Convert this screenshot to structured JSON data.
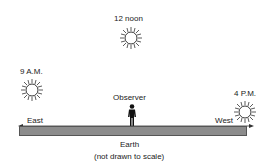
{
  "diagram": {
    "suns": [
      {
        "label": "12 noon",
        "position": "top-center"
      },
      {
        "label": "9 A.M.",
        "position": "left"
      },
      {
        "label": "4 P.M.",
        "position": "right"
      }
    ],
    "observer_label": "Observer",
    "directions": {
      "east": "East",
      "west": "West"
    },
    "ground_label": "Earth",
    "note": "(not drawn to scale)",
    "colors": {
      "ground": "#8c8c8c",
      "line": "#333333"
    }
  }
}
